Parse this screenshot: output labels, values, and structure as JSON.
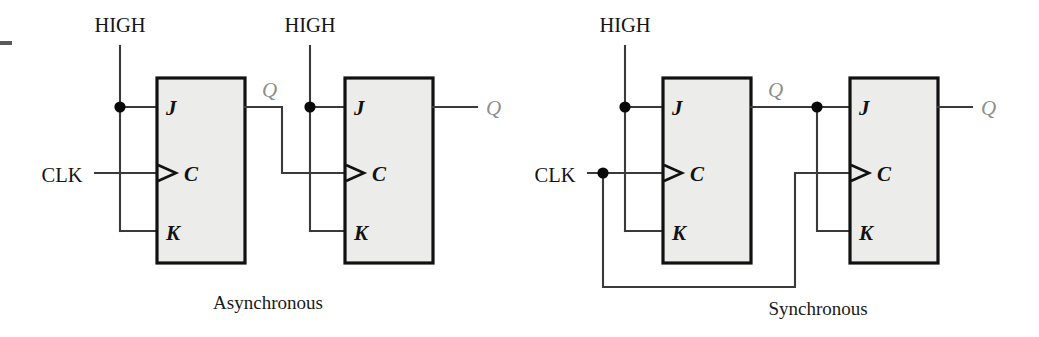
{
  "figure": {
    "title_visible": false,
    "background_color": "#ffffff",
    "box_fill_color": "#ececeb",
    "box_stroke_color": "#111111",
    "wire_color": "#3a3a3a",
    "q_label_color": "#8e8e8e"
  },
  "circuits": [
    {
      "id": "asynchronous",
      "caption": "Asynchronous",
      "caption_x": 268,
      "caption_y": 309,
      "inputs": [
        {
          "name": "high-1",
          "label": "HIGH",
          "x": 120,
          "y": 32
        },
        {
          "name": "clk",
          "label": "CLK",
          "x": 62,
          "y": 176
        },
        {
          "name": "high-2",
          "label": "HIGH",
          "x": 310,
          "y": 32
        }
      ],
      "flipflops": [
        {
          "id": "ff1",
          "x": 157,
          "y": 78,
          "w": 88,
          "h": 185,
          "pins": {
            "j": "J",
            "c": "C",
            "k": "K"
          },
          "j_y": 107,
          "c_y": 173,
          "k_y": 231
        },
        {
          "id": "ff2",
          "x": 345,
          "y": 78,
          "w": 88,
          "h": 185,
          "pins": {
            "j": "J",
            "c": "C",
            "k": "K"
          },
          "j_y": 107,
          "c_y": 173,
          "k_y": 231
        }
      ],
      "outputs": [
        {
          "name": "q1",
          "label": "Q",
          "x": 266,
          "y": 93
        },
        {
          "name": "q2",
          "label": "Q",
          "x": 490,
          "y": 115
        }
      ]
    },
    {
      "id": "synchronous",
      "caption": "Synchronous",
      "caption_x": 818,
      "caption_y": 315,
      "inputs": [
        {
          "name": "high-1",
          "label": "HIGH",
          "x": 625,
          "y": 32
        },
        {
          "name": "clk",
          "label": "CLK",
          "x": 555,
          "y": 176
        }
      ],
      "flipflops": [
        {
          "id": "ff1",
          "x": 663,
          "y": 78,
          "w": 88,
          "h": 185,
          "pins": {
            "j": "J",
            "c": "C",
            "k": "K"
          },
          "j_y": 107,
          "c_y": 173,
          "k_y": 231
        },
        {
          "id": "ff2",
          "x": 850,
          "y": 78,
          "w": 88,
          "h": 185,
          "pins": {
            "j": "J",
            "c": "C",
            "k": "K"
          },
          "j_y": 107,
          "c_y": 173,
          "k_y": 231
        }
      ],
      "outputs": [
        {
          "name": "q1",
          "label": "Q",
          "x": 772,
          "y": 93
        },
        {
          "name": "q2",
          "label": "Q",
          "x": 985,
          "y": 115
        }
      ]
    }
  ],
  "edge_mark": {
    "name": "page-edge-tick",
    "x1": 0,
    "y1": 43,
    "x2": 12,
    "y2": 43
  }
}
